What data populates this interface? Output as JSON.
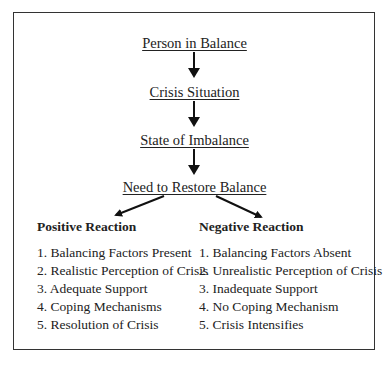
{
  "diagram": {
    "flow": [
      {
        "label": "Person in Balance"
      },
      {
        "label": "Crisis Situation"
      },
      {
        "label": "State of Imbalance"
      },
      {
        "label": "Need to Restore Balance"
      }
    ],
    "branches": {
      "positive": {
        "heading": "Positive Reaction",
        "items": [
          "1. Balancing Factors Present",
          "2. Realistic Perception of Crisis",
          "3. Adequate Support",
          "4. Coping Mechanisms",
          "5. Resolution of Crisis"
        ]
      },
      "negative": {
        "heading": "Negative Reaction",
        "items": [
          "1. Balancing Factors Absent",
          "2. Unrealistic Perception of Crisis",
          "3. Inadequate Support",
          "4. No Coping Mechanism",
          "5. Crisis Intensifies"
        ]
      }
    },
    "colors": {
      "border": "#333333",
      "arrow": "#111111",
      "text": "#222222"
    }
  }
}
